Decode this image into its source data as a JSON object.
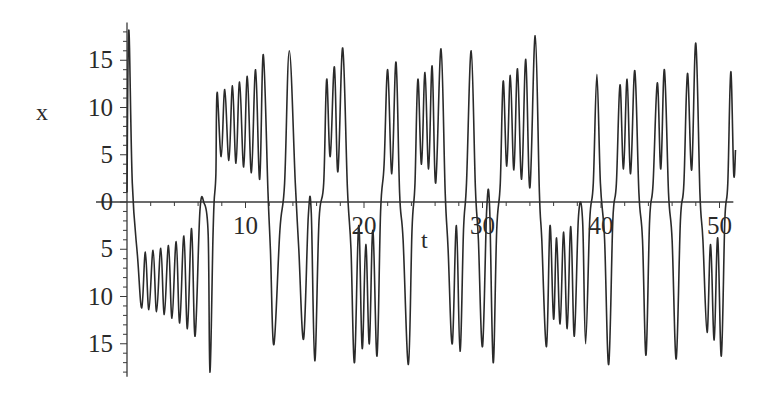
{
  "chart_data": {
    "type": "line",
    "title": "",
    "xlabel": "t",
    "ylabel": "x",
    "xlim": [
      0,
      51
    ],
    "ylim": [
      -18.5,
      19
    ],
    "grid": false,
    "legend": null,
    "x_ticks": [
      10,
      20,
      30,
      40,
      50
    ],
    "x_tick_labels": [
      "10",
      "20",
      "30",
      "40",
      "50"
    ],
    "y_ticks": [
      15,
      10,
      5,
      0,
      -5,
      -10,
      -15
    ],
    "y_tick_labels": [
      "15",
      "10",
      "5",
      "0",
      "5",
      "10",
      "15"
    ],
    "note": "Negative y tick labels are rendered without minus signs in the image.",
    "colors": {
      "line": "#2a2a2a",
      "axis": "#3a3a3a",
      "background": "#ffffff"
    },
    "series": [
      {
        "name": "x(t)",
        "description": "Oscillating trajectory switching between positive and negative lobes (extrema read off plot)",
        "points": [
          [
            0.0,
            1.0
          ],
          [
            0.15,
            18.2
          ],
          [
            0.45,
            2.0
          ],
          [
            0.9,
            -6.0
          ],
          [
            1.25,
            -11.2
          ],
          [
            1.55,
            -5.3
          ],
          [
            1.85,
            -11.4
          ],
          [
            2.2,
            -5.1
          ],
          [
            2.5,
            -11.6
          ],
          [
            2.85,
            -4.9
          ],
          [
            3.15,
            -11.9
          ],
          [
            3.5,
            -4.6
          ],
          [
            3.8,
            -12.3
          ],
          [
            4.15,
            -4.2
          ],
          [
            4.45,
            -12.8
          ],
          [
            4.8,
            -3.6
          ],
          [
            5.1,
            -13.4
          ],
          [
            5.45,
            -2.8
          ],
          [
            5.75,
            -14.2
          ],
          [
            6.15,
            -1.0
          ],
          [
            6.5,
            -0.1
          ],
          [
            6.85,
            -3.5
          ],
          [
            7.0,
            -18.0
          ],
          [
            7.25,
            -4.0
          ],
          [
            7.5,
            3.0
          ],
          [
            7.35,
            0.0
          ],
          [
            7.6,
            11.6
          ],
          [
            7.95,
            4.8
          ],
          [
            8.25,
            11.9
          ],
          [
            8.6,
            4.4
          ],
          [
            8.9,
            12.3
          ],
          [
            9.2,
            4.1
          ],
          [
            9.5,
            12.7
          ],
          [
            9.85,
            3.7
          ],
          [
            10.15,
            13.3
          ],
          [
            10.5,
            3.1
          ],
          [
            10.85,
            14.0
          ],
          [
            11.2,
            2.4
          ],
          [
            11.5,
            15.6
          ],
          [
            11.9,
            1.0
          ],
          [
            12.1,
            -5.0
          ],
          [
            12.4,
            -15.1
          ],
          [
            12.9,
            -3.0
          ],
          [
            13.3,
            2.0
          ],
          [
            13.7,
            16.0
          ],
          [
            14.2,
            2.0
          ],
          [
            14.5,
            -5.0
          ],
          [
            14.9,
            -14.5
          ],
          [
            15.3,
            -1.5
          ],
          [
            15.55,
            -1.2
          ],
          [
            15.85,
            -16.8
          ],
          [
            16.2,
            -2.0
          ],
          [
            16.6,
            2.0
          ],
          [
            16.85,
            13.0
          ],
          [
            17.15,
            4.8
          ],
          [
            17.5,
            14.3
          ],
          [
            17.8,
            3.2
          ],
          [
            18.2,
            16.3
          ],
          [
            18.6,
            1.5
          ],
          [
            18.9,
            -5.0
          ],
          [
            19.2,
            -17.0
          ],
          [
            19.55,
            -2.5
          ],
          [
            19.85,
            -15.5
          ],
          [
            20.15,
            -4.5
          ],
          [
            20.45,
            -15.0
          ],
          [
            20.75,
            -3.0
          ],
          [
            21.1,
            -16.3
          ],
          [
            21.4,
            -1.0
          ],
          [
            21.7,
            4.0
          ],
          [
            22.0,
            14.0
          ],
          [
            22.35,
            3.0
          ],
          [
            22.7,
            14.8
          ],
          [
            23.0,
            1.0
          ],
          [
            23.3,
            -4.0
          ],
          [
            23.75,
            -17.2
          ],
          [
            24.05,
            -3.0
          ],
          [
            24.3,
            2.0
          ],
          [
            24.55,
            13.0
          ],
          [
            24.85,
            4.0
          ],
          [
            25.15,
            13.7
          ],
          [
            25.45,
            3.5
          ],
          [
            25.75,
            14.4
          ],
          [
            26.05,
            2.0
          ],
          [
            26.5,
            16.2
          ],
          [
            26.85,
            1.0
          ],
          [
            27.1,
            -5.0
          ],
          [
            27.45,
            -15.0
          ],
          [
            27.8,
            -2.5
          ],
          [
            28.1,
            -15.8
          ],
          [
            28.4,
            -3.0
          ],
          [
            28.65,
            2.0
          ],
          [
            29.05,
            16.0
          ],
          [
            29.4,
            1.5
          ],
          [
            29.65,
            -4.0
          ],
          [
            30.0,
            -15.3
          ],
          [
            30.35,
            -1.0
          ],
          [
            30.6,
            -0.5
          ],
          [
            30.9,
            -17.0
          ],
          [
            31.2,
            -3.0
          ],
          [
            31.5,
            2.0
          ],
          [
            31.75,
            12.8
          ],
          [
            32.05,
            3.8
          ],
          [
            32.35,
            13.4
          ],
          [
            32.65,
            3.4
          ],
          [
            32.95,
            14.1
          ],
          [
            33.3,
            2.4
          ],
          [
            33.65,
            15.1
          ],
          [
            34.0,
            1.5
          ],
          [
            34.45,
            17.6
          ],
          [
            34.8,
            1.0
          ],
          [
            35.0,
            -4.0
          ],
          [
            35.4,
            -15.3
          ],
          [
            35.7,
            -2.5
          ],
          [
            36.0,
            -12.4
          ],
          [
            36.25,
            -3.8
          ],
          [
            36.55,
            -12.9
          ],
          [
            36.85,
            -3.2
          ],
          [
            37.15,
            -13.4
          ],
          [
            37.45,
            -2.6
          ],
          [
            37.75,
            -14.2
          ],
          [
            38.1,
            -1.5
          ],
          [
            38.45,
            -2.0
          ],
          [
            38.7,
            -15.0
          ],
          [
            39.05,
            -2.0
          ],
          [
            39.35,
            2.0
          ],
          [
            39.65,
            13.5
          ],
          [
            39.95,
            2.0
          ],
          [
            40.3,
            -4.0
          ],
          [
            40.65,
            -17.2
          ],
          [
            41.0,
            -2.0
          ],
          [
            41.3,
            2.0
          ],
          [
            41.6,
            12.4
          ],
          [
            41.9,
            3.5
          ],
          [
            42.2,
            13.0
          ],
          [
            42.5,
            3.0
          ],
          [
            42.85,
            13.9
          ],
          [
            43.2,
            1.0
          ],
          [
            43.5,
            -4.0
          ],
          [
            43.8,
            -16.2
          ],
          [
            44.1,
            -2.0
          ],
          [
            44.4,
            2.0
          ],
          [
            44.75,
            12.6
          ],
          [
            45.05,
            3.5
          ],
          [
            45.35,
            14.0
          ],
          [
            45.7,
            1.0
          ],
          [
            46.0,
            -4.0
          ],
          [
            46.35,
            -16.6
          ],
          [
            46.7,
            -2.0
          ],
          [
            47.0,
            2.0
          ],
          [
            47.3,
            13.6
          ],
          [
            47.65,
            3.4
          ],
          [
            48.0,
            16.8
          ],
          [
            48.35,
            1.0
          ],
          [
            48.6,
            -4.0
          ],
          [
            48.95,
            -13.8
          ],
          [
            49.25,
            -4.5
          ],
          [
            49.55,
            -14.6
          ],
          [
            49.85,
            -3.8
          ],
          [
            50.15,
            -16.3
          ],
          [
            50.45,
            -2.0
          ],
          [
            50.7,
            2.0
          ],
          [
            50.95,
            13.8
          ],
          [
            51.2,
            3.0
          ],
          [
            51.35,
            5.5
          ]
        ]
      }
    ]
  },
  "plot": {
    "x_axis_label": "t",
    "y_axis_label": "x"
  }
}
